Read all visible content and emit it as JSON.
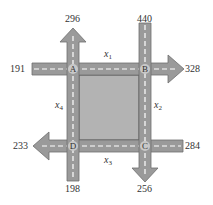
{
  "diagram": {
    "type": "traffic-flow-network",
    "intersections": [
      "A",
      "B",
      "C",
      "D"
    ],
    "external_flows": [
      {
        "id": "in-A-west",
        "value": "191",
        "direction": "in",
        "intersection": "A"
      },
      {
        "id": "out-A-north",
        "value": "296",
        "direction": "out",
        "intersection": "A"
      },
      {
        "id": "in-B-north",
        "value": "440",
        "direction": "in",
        "intersection": "B"
      },
      {
        "id": "out-B-east",
        "value": "328",
        "direction": "out",
        "intersection": "B"
      },
      {
        "id": "in-C-east",
        "value": "284",
        "direction": "in",
        "intersection": "C"
      },
      {
        "id": "out-C-south",
        "value": "256",
        "direction": "out",
        "intersection": "C"
      },
      {
        "id": "in-D-south",
        "value": "198",
        "direction": "in",
        "intersection": "D"
      },
      {
        "id": "out-D-west",
        "value": "233",
        "direction": "out",
        "intersection": "D"
      }
    ],
    "internal_flows": [
      {
        "name": "x",
        "sub": "1",
        "between": "A-B"
      },
      {
        "name": "x",
        "sub": "2",
        "between": "B-C"
      },
      {
        "name": "x",
        "sub": "3",
        "between": "C-D"
      },
      {
        "name": "x",
        "sub": "4",
        "between": "D-A"
      }
    ],
    "colors": {
      "road": "#9a9a9a",
      "block": "#b3b3b3",
      "dash": "#ffffff",
      "edge": "#6e6e6e"
    }
  }
}
